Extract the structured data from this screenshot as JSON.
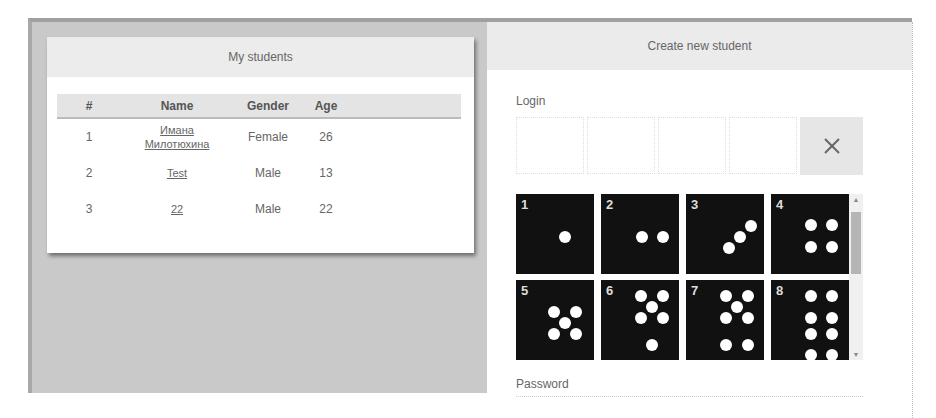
{
  "students_panel": {
    "title": "My students",
    "columns": [
      "#",
      "Name",
      "Gender",
      "Age"
    ],
    "rows": [
      {
        "num": "1",
        "name_line1": "Имана",
        "name_line2": "Милотюхина",
        "gender": "Female",
        "age": "26"
      },
      {
        "num": "2",
        "name_line1": "Test",
        "name_line2": "",
        "gender": "Male",
        "age": "13"
      },
      {
        "num": "3",
        "name_line1": "22",
        "name_line2": "",
        "gender": "Male",
        "age": "22"
      }
    ]
  },
  "create_panel": {
    "title": "Create new student",
    "login_label": "Login",
    "clear_icon": "close-icon",
    "password_label": "Password",
    "tiles": [
      {
        "label": "1"
      },
      {
        "label": "2"
      },
      {
        "label": "3"
      },
      {
        "label": "4"
      },
      {
        "label": "5"
      },
      {
        "label": "6"
      },
      {
        "label": "7"
      },
      {
        "label": "8"
      }
    ]
  }
}
